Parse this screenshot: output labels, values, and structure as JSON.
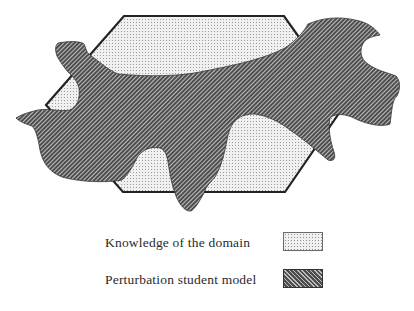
{
  "diagram": {
    "shapes": [
      {
        "id": "domain",
        "type": "hexagon",
        "fill_pattern": "dots",
        "meaning": "Knowledge of the domain"
      },
      {
        "id": "student-model",
        "type": "irregular-blob",
        "fill_pattern": "diagonal-hatch",
        "meaning": "Perturbation student model"
      }
    ],
    "colors": {
      "outline": "#222222",
      "dot_fill_bg": "#f2f2f2",
      "dot_color": "#9a9a9a",
      "hatch_bg": "#5a5a5a",
      "hatch_line": "#cfcfcf"
    }
  },
  "legend": {
    "items": [
      {
        "label": "Knowledge of the domain",
        "pattern": "dots"
      },
      {
        "label": "Perturbation student model",
        "pattern": "diagonal-hatch"
      }
    ]
  }
}
